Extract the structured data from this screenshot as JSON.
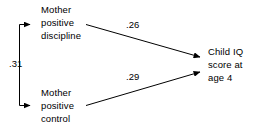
{
  "diagram": {
    "type": "path-diagram",
    "background_color": "#ffffff",
    "line_color": "#000000",
    "text_color": "#000000",
    "nodes": [
      {
        "id": "mother-positive-discipline",
        "lines": [
          "Mother",
          "positive",
          "discipline"
        ],
        "line1": "Mother",
        "line2": "positive",
        "line3": "discipline"
      },
      {
        "id": "mother-positive-control",
        "lines": [
          "Mother",
          "positive",
          "control"
        ],
        "line1": "Mother",
        "line2": "positive",
        "line3": "control"
      },
      {
        "id": "child-iq-score-age-4",
        "lines": [
          "Child IQ",
          "score at",
          "age 4"
        ],
        "line1": "Child IQ",
        "line2": "score at",
        "line3": "age 4"
      }
    ],
    "paths": [
      {
        "id": "discipline-to-iq",
        "from": "mother-positive-discipline",
        "to": "child-iq-score-age-4",
        "coefficient": ".26",
        "arrow": "single"
      },
      {
        "id": "control-to-iq",
        "from": "mother-positive-control",
        "to": "child-iq-score-age-4",
        "coefficient": ".29",
        "arrow": "single"
      },
      {
        "id": "discipline-control-correlation",
        "from": "mother-positive-discipline",
        "to": "mother-positive-control",
        "coefficient": ".31",
        "arrow": "double"
      }
    ]
  }
}
